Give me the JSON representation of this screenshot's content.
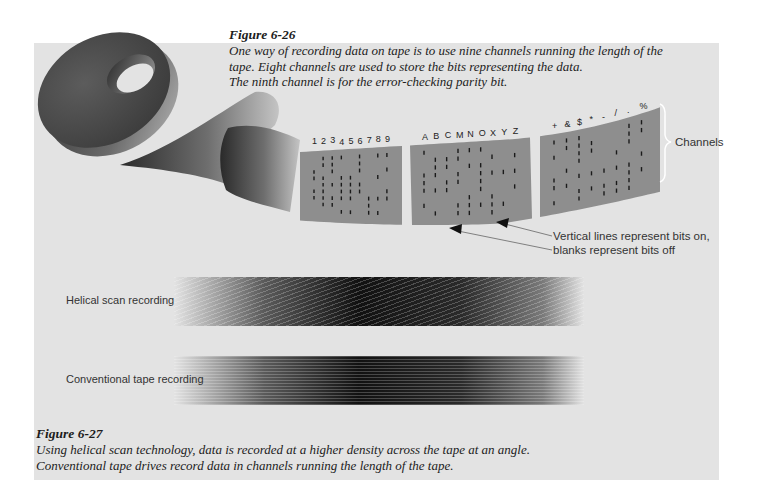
{
  "figure_6_26": {
    "title": "Figure 6-26",
    "lines": [
      "One way of recording data on tape is to use nine channels running the length of the",
      "tape. Eight channels are used to store the bits representing the data.",
      "The ninth channel is for the error-checking parity bit."
    ],
    "illustration": {
      "segment_labels": [
        [
          "1",
          "2",
          "3",
          "4",
          "5",
          "6",
          "7",
          "8",
          "9"
        ],
        [
          "A",
          "B",
          "C",
          "M",
          "N",
          "O",
          "X",
          "Y",
          "Z"
        ],
        [
          "+",
          "&",
          "$",
          "*",
          "-",
          "/",
          ".",
          "%"
        ]
      ],
      "channels_label": "Channels",
      "annotation_lines": [
        "Vertical lines represent bits on,",
        "blanks represent bits off"
      ]
    }
  },
  "figure_6_27": {
    "title": "Figure 6-27",
    "lines": [
      "Using helical scan technology, data is recorded at a higher density across the tape at an angle.",
      "Conventional tape drives record data in channels running the length of the tape."
    ],
    "bars": [
      {
        "label": "Helical scan recording"
      },
      {
        "label": "Conventional tape recording"
      }
    ]
  },
  "colors": {
    "panel": "#e3e3e3",
    "tape_surface": "#8e8e8e",
    "reel": "#4a4a4a",
    "text": "#1c1c1c"
  }
}
